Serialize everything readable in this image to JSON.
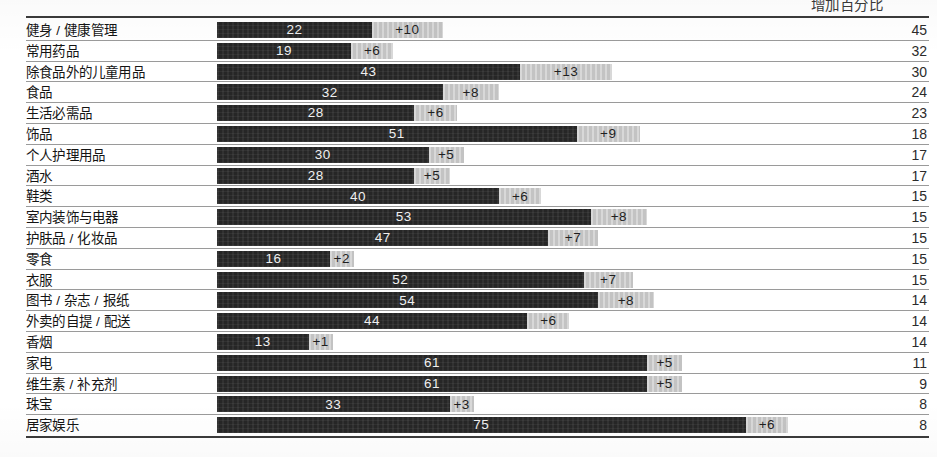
{
  "header": {
    "right_label": "增加百分比"
  },
  "columns": {
    "category": "",
    "bar": "",
    "total": ""
  },
  "chart_data": {
    "type": "bar",
    "title": "",
    "subtitle": "",
    "xlabel": "",
    "ylabel": "",
    "legend": [
      "增加百分比"
    ],
    "legend_position": "top-right",
    "grid": false,
    "orientation": "horizontal",
    "stacked": true,
    "xlim": [
      0,
      81
    ],
    "axis_unit": "%",
    "categories": [
      "健身 / 健康管理",
      "常用药品",
      "除食品外的儿童用品",
      "食品",
      "生活必需品",
      "饰品",
      "个人护理用品",
      "酒水",
      "鞋类",
      "室内装饰与电器",
      "护肤品 / 化妆品",
      "零食",
      "衣服",
      "图书 / 杂志 / 报纸",
      "外卖的自提 / 配送",
      "香烟",
      "家电",
      "维生素 / 补充剂",
      "珠宝",
      "居家娱乐"
    ],
    "series": [
      {
        "name": "基数",
        "values": [
          22,
          19,
          43,
          32,
          28,
          51,
          30,
          28,
          40,
          53,
          47,
          16,
          52,
          54,
          44,
          13,
          61,
          61,
          33,
          75
        ]
      },
      {
        "name": "增加百分比",
        "values": [
          10,
          6,
          13,
          8,
          6,
          9,
          5,
          5,
          6,
          8,
          7,
          2,
          7,
          8,
          6,
          1,
          5,
          5,
          3,
          6
        ]
      }
    ],
    "totals": [
      45,
      32,
      30,
      24,
      23,
      18,
      17,
      17,
      15,
      15,
      15,
      15,
      15,
      14,
      14,
      14,
      11,
      9,
      8,
      8
    ]
  },
  "rows": [
    {
      "label": "健身 / 健康管理",
      "base": 22,
      "base_text": "22",
      "growth": 10,
      "growth_text": "+10",
      "total": "45"
    },
    {
      "label": "常用药品",
      "base": 19,
      "base_text": "19",
      "growth": 6,
      "growth_text": "+6",
      "total": "32"
    },
    {
      "label": "除食品外的儿童用品",
      "base": 43,
      "base_text": "43",
      "growth": 13,
      "growth_text": "+13",
      "total": "30"
    },
    {
      "label": "食品",
      "base": 32,
      "base_text": "32",
      "growth": 8,
      "growth_text": "+8",
      "total": "24"
    },
    {
      "label": "生活必需品",
      "base": 28,
      "base_text": "28",
      "growth": 6,
      "growth_text": "+6",
      "total": "23"
    },
    {
      "label": "饰品",
      "base": 51,
      "base_text": "51",
      "growth": 9,
      "growth_text": "+9",
      "total": "18"
    },
    {
      "label": "个人护理用品",
      "base": 30,
      "base_text": "30",
      "growth": 5,
      "growth_text": "+5",
      "total": "17"
    },
    {
      "label": "酒水",
      "base": 28,
      "base_text": "28",
      "growth": 5,
      "growth_text": "+5",
      "total": "17"
    },
    {
      "label": "鞋类",
      "base": 40,
      "base_text": "40",
      "growth": 6,
      "growth_text": "+6",
      "total": "15"
    },
    {
      "label": "室内装饰与电器",
      "base": 53,
      "base_text": "53",
      "growth": 8,
      "growth_text": "+8",
      "total": "15"
    },
    {
      "label": "护肤品 / 化妆品",
      "base": 47,
      "base_text": "47",
      "growth": 7,
      "growth_text": "+7",
      "total": "15"
    },
    {
      "label": "零食",
      "base": 16,
      "base_text": "16",
      "growth": 2,
      "growth_text": "+2",
      "total": "15"
    },
    {
      "label": "衣服",
      "base": 52,
      "base_text": "52",
      "growth": 7,
      "growth_text": "+7",
      "total": "15"
    },
    {
      "label": "图书 / 杂志 / 报纸",
      "base": 54,
      "base_text": "54",
      "growth": 8,
      "growth_text": "+8",
      "total": "14"
    },
    {
      "label": "外卖的自提 / 配送",
      "base": 44,
      "base_text": "44",
      "growth": 6,
      "growth_text": "+6",
      "total": "14"
    },
    {
      "label": "香烟",
      "base": 13,
      "base_text": "13",
      "growth": 1,
      "growth_text": "+1",
      "total": "14"
    },
    {
      "label": "家电",
      "base": 61,
      "base_text": "61",
      "growth": 5,
      "growth_text": "+5",
      "total": "11"
    },
    {
      "label": "维生素 / 补充剂",
      "base": 61,
      "base_text": "61",
      "growth": 5,
      "growth_text": "+5",
      "total": "9"
    },
    {
      "label": "珠宝",
      "base": 33,
      "base_text": "33",
      "growth": 3,
      "growth_text": "+3",
      "total": "8"
    },
    {
      "label": "居家娱乐",
      "base": 75,
      "base_text": "75",
      "growth": 6,
      "growth_text": "+6",
      "total": "8"
    }
  ],
  "style": {
    "base_color": "#262626",
    "growth_color": "#c3c3c3",
    "rule_color": "#3b3b3b",
    "separator_color": "#9a9a9a",
    "px_per_unit": 7.05
  }
}
